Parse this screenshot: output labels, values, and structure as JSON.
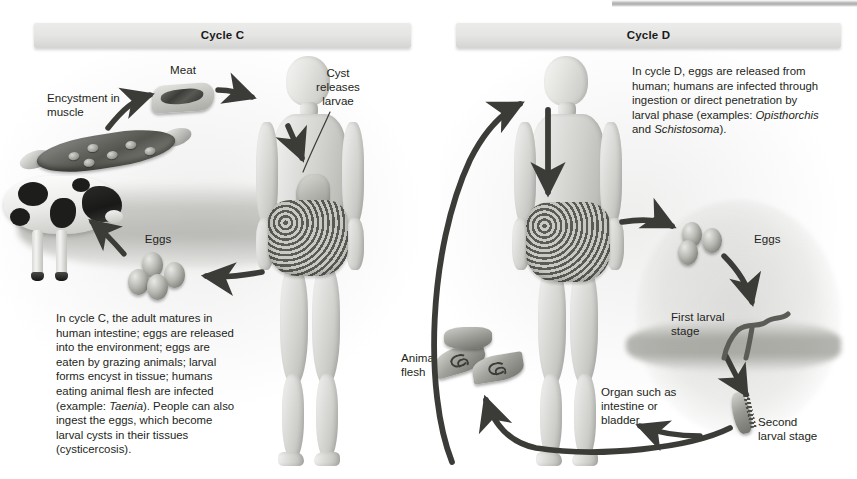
{
  "figure": {
    "width": 857,
    "height": 479,
    "background_color": "#ffffff",
    "ink_color": "#231f20"
  },
  "panels": [
    {
      "id": "cycle-c",
      "banner_label": "Cycle C",
      "labels": [
        {
          "name": "encystment-in-muscle",
          "text": "Encystment in\nmuscle"
        },
        {
          "name": "meat",
          "text": "Meat"
        },
        {
          "name": "cyst-releases-larvae",
          "text": "Cyst\nreleases\nlarvae"
        },
        {
          "name": "eggs",
          "text": "Eggs"
        }
      ],
      "caption": {
        "lead": "In cycle C, the adult matures in human intestine; eggs are released into the environment; eggs are eaten by grazing animals; larval forms encyst in tissue; humans eating animal flesh are infected (example: ",
        "species": "Taenia",
        "tail": "). People can also ingest the eggs, which become larval cysts in their tissues (cysticercosis)."
      },
      "illustrations": [
        "muscle-fiber-with-cysts",
        "steak",
        "holstein-cow",
        "egg-cluster",
        "human-figure-with-stomach-and-intestine"
      ]
    },
    {
      "id": "cycle-d",
      "banner_label": "Cycle D",
      "labels": [
        {
          "name": "eggs",
          "text": "Eggs"
        },
        {
          "name": "first-larval-stage",
          "text": "First larval\nstage"
        },
        {
          "name": "second-larval-stage",
          "text": "Second\nlarval stage"
        },
        {
          "name": "organ-such-as-intestine-or-bladder",
          "text": "Organ such as\nintestine or\nbladder"
        },
        {
          "name": "animal-flesh",
          "text": "Animal\nflesh"
        }
      ],
      "caption": {
        "lead": "In cycle D, eggs are released from human; humans are infected through ingestion or direct penetration by larval phase (examples: ",
        "species": "Opisthorchis",
        "mid": " and ",
        "species2": "Schistosoma",
        "tail": ")."
      },
      "illustrations": [
        "human-figure-with-intestine",
        "egg-cluster",
        "fork-tailed-cercaria",
        "metacercaria",
        "fluke-pair-animal-flesh"
      ]
    }
  ],
  "colors": {
    "banner_top": "#ececeb",
    "banner_bottom": "#d4d4d3",
    "arrow": "#3b3b38",
    "text": "#231f20",
    "page": "#ffffff"
  }
}
